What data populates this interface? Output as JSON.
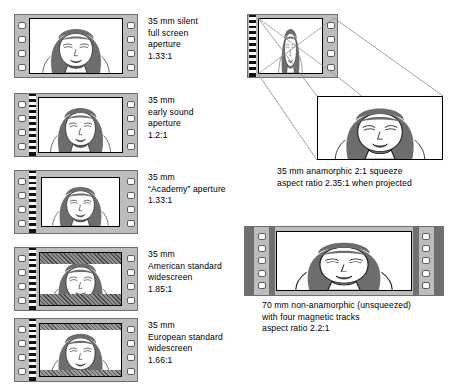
{
  "diagram": {
    "items": [
      {
        "id": "silent",
        "caption": "35 mm silent\nfull screen\naperture\n1.33:1",
        "format": "35 mm",
        "name": "silent full screen aperture",
        "aspect_ratio": "1.33:1",
        "has_soundtrack": false
      },
      {
        "id": "early-sound",
        "caption": "35 mm\nearly sound\naperture\n1.2:1",
        "format": "35 mm",
        "name": "early sound aperture",
        "aspect_ratio": "1.2:1",
        "has_soundtrack": true
      },
      {
        "id": "academy",
        "caption": "35 mm\n“Academy” aperture\n1.33:1",
        "format": "35 mm",
        "name": "“Academy” aperture",
        "aspect_ratio": "1.33:1",
        "has_soundtrack": true
      },
      {
        "id": "american-widescreen",
        "caption": "35 mm\nAmerican standard\nwidescreen\n1.85:1",
        "format": "35 mm",
        "name": "American standard widescreen",
        "aspect_ratio": "1.85:1",
        "has_soundtrack": true,
        "masked": true
      },
      {
        "id": "european-widescreen",
        "caption": "35 mm\nEuropean standard\nwidescreen\n1.66:1",
        "format": "35 mm",
        "name": "European standard widescreen",
        "aspect_ratio": "1.66:1",
        "has_soundtrack": true,
        "masked": true
      }
    ],
    "anamorphic": {
      "caption": "35 mm anamorphic 2:1 squeeze\naspect ratio 2.35:1 when projected",
      "format": "35 mm",
      "name": "anamorphic 2:1 squeeze",
      "aspect_ratio": "2.35:1"
    },
    "seventy": {
      "caption": "70 mm non-anamorphic (unsqueezed)\nwith four magnetic tracks\naspect ratio 2.2:1",
      "format": "70 mm",
      "name": "non-anamorphic (unsqueezed) with four magnetic tracks",
      "aspect_ratio": "2.2:1"
    }
  },
  "colors": {
    "film_base": "#bdbdbd",
    "frame": "#ffffff",
    "sprocket": "#ffffff",
    "soundtrack": "#111111",
    "mask": "#8d8d8d",
    "magnetic_track": "#6f6f6f",
    "ink": "#000000",
    "hair": "#6d6d6d"
  }
}
